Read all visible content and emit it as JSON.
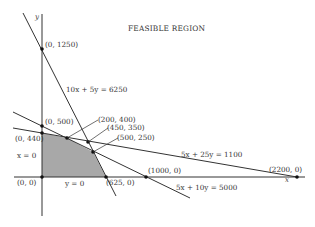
{
  "title": "FEASIBLE REGION",
  "axes": {
    "x_label": "x",
    "y_label": "y"
  },
  "colors": {
    "region_fill": "#a8a8a8",
    "line": "#333333",
    "text": "#333333"
  },
  "constraints": [
    {
      "label": "10x + 5y = 6250"
    },
    {
      "label": "5x + 25y = 1100"
    },
    {
      "label": "5x + 10y = 5000"
    },
    {
      "label": "x = 0"
    },
    {
      "label": "y = 0"
    }
  ],
  "points": [
    {
      "label": "(0, 1250)"
    },
    {
      "label": "(0, 500)"
    },
    {
      "label": "(0, 440)"
    },
    {
      "label": "(0, 0)"
    },
    {
      "label": "(200, 400)"
    },
    {
      "label": "(450, 350)"
    },
    {
      "label": "(500, 250)"
    },
    {
      "label": "(625, 0)"
    },
    {
      "label": "(1000, 0)"
    },
    {
      "label": "(2200, 0)"
    }
  ]
}
